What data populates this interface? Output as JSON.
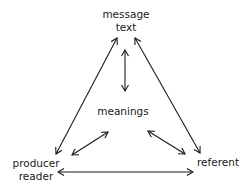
{
  "diagram": {
    "type": "triangle-relationship",
    "nodes": {
      "top": {
        "line1": "message",
        "line2": "text"
      },
      "center": {
        "label": "meanings"
      },
      "bottom_left": {
        "line1": "producer",
        "line2": "reader"
      },
      "bottom_right": {
        "label": "referent"
      }
    },
    "edges": [
      {
        "from": "message text",
        "to": "producer reader",
        "style": "double-headed arrow"
      },
      {
        "from": "message text",
        "to": "referent",
        "style": "double-headed arrow"
      },
      {
        "from": "message text",
        "to": "meanings",
        "style": "double-headed arrow"
      },
      {
        "from": "meanings",
        "to": "producer reader",
        "style": "double-headed arrow"
      },
      {
        "from": "meanings",
        "to": "referent",
        "style": "double-headed arrow"
      },
      {
        "from": "producer reader",
        "to": "referent",
        "style": "double-headed arrow"
      }
    ],
    "colors": {
      "ink": "#1a1a1a",
      "background": "#ffffff"
    }
  }
}
